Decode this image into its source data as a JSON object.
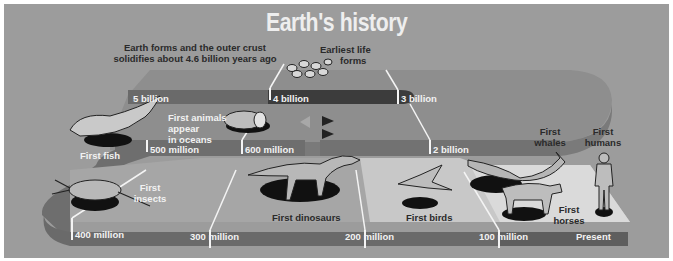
{
  "title": "Earth's history",
  "colors": {
    "background": "#9c9c9c",
    "band_mid": "#6c6c6c",
    "band_dark": "#3a3a3a",
    "upper_surface": "#8a8a8a",
    "floor": "#d6d6d6",
    "label_light": "#f2f2f2",
    "label_dark": "#2a2a2a"
  },
  "captions": {
    "earth_forms": [
      "Earth forms and the outer crust",
      "solidifies about 4.6 billion years ago"
    ],
    "earliest_life": [
      "Earliest life",
      "forms"
    ]
  },
  "timeline_markers": [
    {
      "label": "5 billion"
    },
    {
      "label": "4 billion"
    },
    {
      "label": "3 billion"
    },
    {
      "label": "2 billion"
    },
    {
      "label": "600 million"
    },
    {
      "label": "500 million"
    },
    {
      "label": "400 million"
    },
    {
      "label": "300 million"
    },
    {
      "label": "200 million"
    },
    {
      "label": "100 million"
    },
    {
      "label": "Present"
    }
  ],
  "events": [
    {
      "label": "First animals appear in oceans",
      "lines": [
        "First animals",
        "appear",
        "in oceans"
      ],
      "icon": "worm-icon"
    },
    {
      "label": "First fish",
      "lines": [
        "First fish"
      ],
      "icon": "fish-icon"
    },
    {
      "label": "First insects",
      "lines": [
        "First",
        "insects"
      ],
      "icon": "insect-icon"
    },
    {
      "label": "First dinosaurs",
      "lines": [
        "First dinosaurs"
      ],
      "icon": "dinosaur-icon"
    },
    {
      "label": "First birds",
      "lines": [
        "First birds"
      ],
      "icon": "bird-icon"
    },
    {
      "label": "First whales",
      "lines": [
        "First",
        "whales"
      ],
      "icon": "whale-icon"
    },
    {
      "label": "First horses",
      "lines": [
        "First",
        "horses"
      ],
      "icon": "horse-icon"
    },
    {
      "label": "First humans",
      "lines": [
        "First",
        "humans"
      ],
      "icon": "human-icon"
    }
  ]
}
